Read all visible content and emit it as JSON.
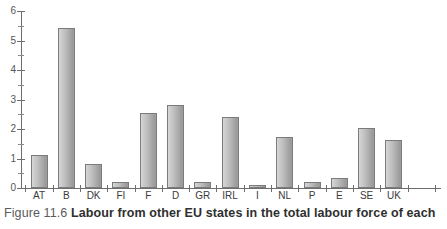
{
  "chart_data": {
    "type": "bar",
    "title": "",
    "xlabel": "",
    "ylabel": "",
    "ylim": [
      0,
      6
    ],
    "yticks": [
      0,
      1,
      2,
      3,
      4,
      5,
      6
    ],
    "ytick_labels": [
      "0",
      "1",
      "2",
      "3",
      "4",
      "5",
      "6"
    ],
    "yminor_ticks": [
      0.5,
      1.5,
      2.5,
      3.5,
      4.5,
      5.5
    ],
    "grid": false,
    "legend": "none",
    "categories": [
      "AT",
      "B",
      "DK",
      "FI",
      "F",
      "D",
      "GR",
      "IRL",
      "I",
      "NL",
      "P",
      "E",
      "SE",
      "UK"
    ],
    "values": [
      1.12,
      5.43,
      0.82,
      0.22,
      2.54,
      2.81,
      0.22,
      2.42,
      0.1,
      1.73,
      0.22,
      0.33,
      2.02,
      1.63
    ]
  },
  "caption": {
    "figure_number": "Figure 11.6",
    "text": "Labour from other EU states in the total labour force of each"
  },
  "style": {
    "bar_outline": "#7b7b7b",
    "bar_fill_light": "#d8d8d8",
    "bar_fill_dark": "#9a9a9a",
    "axis_color": "#6e6e6e",
    "tick_label_color": "#555555",
    "caption_color": "#2f2f2f",
    "background": "#ffffff"
  }
}
